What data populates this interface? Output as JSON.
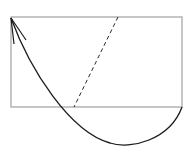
{
  "diagram": {
    "colors": {
      "background": "#ffffff",
      "rectangle_stroke": "#a8a8a8",
      "curve_stroke": "#1a1a1a",
      "dashed_stroke": "#2a2a2a"
    },
    "rectangle": {
      "x": 11,
      "y": 17,
      "width": 171,
      "height": 90
    },
    "dashed_line": {
      "x1": 118,
      "y1": 17,
      "x2": 74,
      "y2": 107
    },
    "curve": {
      "start": [
        182,
        107
      ],
      "control": [
        130,
        190
      ],
      "end": [
        11,
        18
      ],
      "arrowhead_at": "end"
    }
  }
}
